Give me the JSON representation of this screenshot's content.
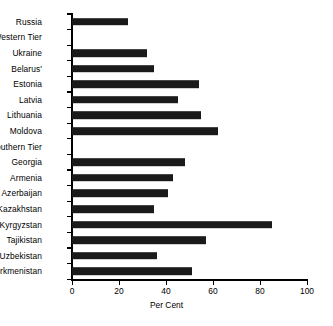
{
  "chart_data": {
    "type": "bar",
    "orientation": "horizontal",
    "title": "",
    "xlabel": "Per Cent",
    "ylabel": "",
    "xlim": [
      0,
      100
    ],
    "xticks": [
      0,
      20,
      40,
      60,
      80,
      100
    ],
    "grid": false,
    "legend": null,
    "categories": [
      "Russia",
      "Western Tier",
      "Ukraine",
      "Belarus'",
      "Estonia",
      "Latvia",
      "Lithuania",
      "Moldova",
      "Southern Tier",
      "Georgia",
      "Armenia",
      "Azerbaijan",
      "Kazakhstan",
      "Kyrgyzstan",
      "Tajikistan",
      "Uzbekistan",
      "Turkmenistan"
    ],
    "values": [
      24,
      null,
      32,
      35,
      54,
      45,
      55,
      62,
      null,
      48,
      43,
      41,
      35,
      85,
      57,
      36,
      51
    ],
    "group_headers": [
      "Western Tier",
      "Southern Tier"
    ],
    "bar_color": "#1a1a1a"
  },
  "axis": {
    "x_title": "Per Cent"
  },
  "caption": {
    "text": ""
  }
}
